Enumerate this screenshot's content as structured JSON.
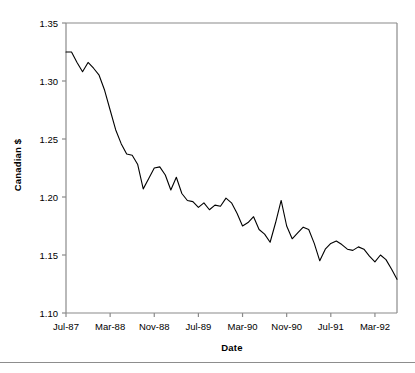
{
  "chart_data": {
    "type": "line",
    "title": "",
    "xlabel": "Date",
    "ylabel": "Canadian $",
    "ylim": [
      1.1,
      1.35
    ],
    "ytick_labels": [
      "1.10",
      "1.15",
      "1.20",
      "1.25",
      "1.30",
      "1.35"
    ],
    "ytick_values": [
      1.1,
      1.15,
      1.2,
      1.25,
      1.3,
      1.35
    ],
    "xtick_labels": [
      "Jul-87",
      "Mar-88",
      "Nov-88",
      "Jul-89",
      "Mar-90",
      "Nov-90",
      "Jul-91",
      "Mar-92"
    ],
    "xtick_indices": [
      0,
      8,
      16,
      24,
      32,
      40,
      48,
      56
    ],
    "grid": false,
    "legend": "none",
    "line_color": "#000000",
    "axis_color": "#808080",
    "background_color": "#ffffff",
    "x": [
      "Jul-87",
      "Aug-87",
      "Sep-87",
      "Oct-87",
      "Nov-87",
      "Dec-87",
      "Jan-88",
      "Feb-88",
      "Mar-88",
      "Apr-88",
      "May-88",
      "Jun-88",
      "Jul-88",
      "Aug-88",
      "Sep-88",
      "Oct-88",
      "Nov-88",
      "Dec-88",
      "Jan-89",
      "Feb-89",
      "Mar-89",
      "Apr-89",
      "May-89",
      "Jun-89",
      "Jul-89",
      "Aug-89",
      "Sep-89",
      "Oct-89",
      "Nov-89",
      "Dec-89",
      "Jan-90",
      "Feb-90",
      "Mar-90",
      "Apr-90",
      "May-90",
      "Jun-90",
      "Jul-90",
      "Aug-90",
      "Sep-90",
      "Oct-90",
      "Nov-90",
      "Dec-90",
      "Jan-91",
      "Feb-91",
      "Mar-91",
      "Apr-91",
      "May-91",
      "Jun-91",
      "Jul-91",
      "Aug-91",
      "Sep-91",
      "Oct-91",
      "Nov-91",
      "Dec-91",
      "Jan-92",
      "Feb-92",
      "Mar-92",
      "Apr-92",
      "May-92",
      "Jun-92",
      "Jul-92"
    ],
    "values": [
      1.325,
      1.325,
      1.316,
      1.308,
      1.316,
      1.311,
      1.305,
      1.292,
      1.275,
      1.258,
      1.246,
      1.237,
      1.236,
      1.228,
      1.207,
      1.216,
      1.225,
      1.226,
      1.219,
      1.206,
      1.217,
      1.203,
      1.197,
      1.196,
      1.191,
      1.195,
      1.189,
      1.193,
      1.192,
      1.199,
      1.195,
      1.186,
      1.175,
      1.178,
      1.183,
      1.172,
      1.168,
      1.161,
      1.178,
      1.197,
      1.175,
      1.164,
      1.169,
      1.174,
      1.172,
      1.16,
      1.145,
      1.155,
      1.16,
      1.162,
      1.159,
      1.155,
      1.154,
      1.157,
      1.155,
      1.149,
      1.144,
      1.15,
      1.146,
      1.138,
      1.129
    ]
  },
  "axes": {
    "plot_left": 66,
    "plot_right": 397,
    "plot_top": 23,
    "plot_bottom": 313
  }
}
